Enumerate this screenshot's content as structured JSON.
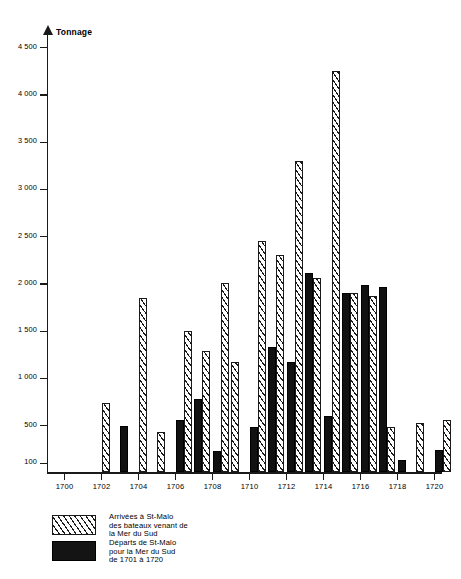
{
  "chart_data": {
    "type": "bar",
    "title": "",
    "ylabel": "Tonnage",
    "xlabel": "",
    "ylim": [
      0,
      4600
    ],
    "xlim": [
      1700,
      1721
    ],
    "grid": false,
    "legend_position": "below-left",
    "ytick_labels": [
      "4 500",
      "4 000",
      "3 500",
      "3 000",
      "2 500",
      "2 000",
      "1 500",
      "1 000",
      "500",
      "100"
    ],
    "ytick_values": [
      4500,
      4000,
      3500,
      3000,
      2500,
      2000,
      1500,
      1000,
      500,
      100
    ],
    "xtick_labels": [
      "1700",
      "1702",
      "1704",
      "1706",
      "1708",
      "1710",
      "1712",
      "1714",
      "1716",
      "1718",
      "1720"
    ],
    "xtick_values": [
      1700,
      1702,
      1704,
      1706,
      1708,
      1710,
      1712,
      1714,
      1716,
      1718,
      1720
    ],
    "x": [
      1700,
      1701,
      1702,
      1703,
      1704,
      1705,
      1706,
      1707,
      1708,
      1709,
      1710,
      1711,
      1712,
      1713,
      1714,
      1715,
      1716,
      1717,
      1718,
      1719,
      1720
    ],
    "series": [
      {
        "name": "Arrivées à St-Malo des bateaux venant de la Mer du Sud",
        "pattern": "hatched",
        "color": "#ffffff",
        "values": [
          0,
          0,
          730,
          0,
          1850,
          430,
          1500,
          1280,
          2000,
          1170,
          2450,
          2300,
          3300,
          2060,
          4250,
          1900,
          1870,
          480,
          0,
          520,
          560
        ]
      },
      {
        "name": "Départs de St-Malo pour la Mer du Sud de 1701 à 1720",
        "pattern": "solid",
        "color": "#111111",
        "values": [
          0,
          0,
          0,
          490,
          0,
          0,
          550,
          780,
          230,
          0,
          480,
          1330,
          1170,
          2110,
          600,
          1900,
          1980,
          1960,
          130,
          0,
          240
        ]
      }
    ]
  },
  "legend": {
    "items": [
      {
        "swatch": "hatched",
        "lines": [
          "Arrivées à St-Malo",
          "des bateaux venant de",
          "la Mer du Sud"
        ]
      },
      {
        "swatch": "solid",
        "lines": [
          "Départs de St-Malo",
          "pour la Mer du Sud",
          "de 1701 à 1720"
        ]
      }
    ]
  }
}
